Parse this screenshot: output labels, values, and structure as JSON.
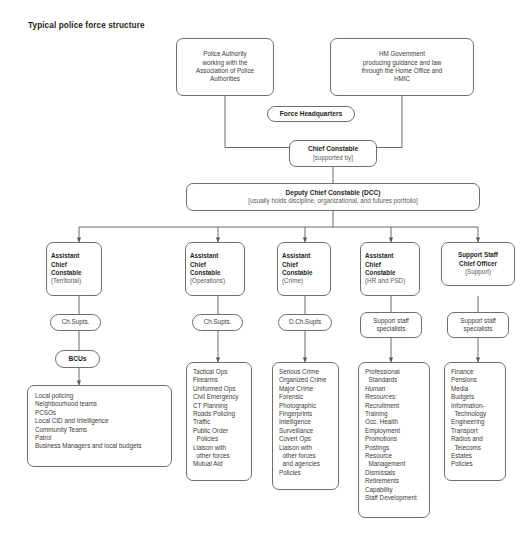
{
  "title": "Typical police force structure",
  "nodes": {
    "police_authority": {
      "name": "police-authority-box",
      "lines": [
        "Police Authority",
        "working with the",
        "Association of Police",
        "Authorities"
      ]
    },
    "hm_government": {
      "name": "hm-government-box",
      "lines": [
        "HM Government",
        "producing guidance and law",
        "through the Home Office and",
        "HMIC"
      ]
    },
    "force_headquarters": {
      "name": "force-headquarters-box",
      "label": "Force Headquarters"
    },
    "chief_constable": {
      "name": "chief-constable-box",
      "title": "Chief Constable",
      "sub": "[supported by]"
    },
    "dcc": {
      "name": "deputy-chief-constable-box",
      "title": "Deputy Chief Constable (DCC)",
      "sub": "[usually holds discipline, organizational, and futures portfolio]"
    }
  },
  "columns": [
    {
      "key": "territorial",
      "head": {
        "name": "acc-territorial-box",
        "title_lines": [
          "Assistant",
          "Chief",
          "Constable"
        ],
        "sub": "(Territorial)"
      },
      "mid": {
        "name": "ch-supts-territorial-box",
        "lines": [
          "Ch.Supts."
        ]
      },
      "sub_node": {
        "name": "bcus-box",
        "label": "BCUs"
      },
      "list": {
        "name": "territorial-functions-box",
        "items": [
          "Local policing",
          "Neighbourhood teams",
          "PCSOs",
          "Local CID and Intelligence",
          "Community Teams",
          "Patrol",
          "Business Managers and local budgets"
        ]
      }
    },
    {
      "key": "operations",
      "head": {
        "name": "acc-operations-box",
        "title_lines": [
          "Assistant",
          "Chief",
          "Constable"
        ],
        "sub": "(Operations)"
      },
      "mid": {
        "name": "ch-supts-operations-box",
        "lines": [
          "Ch.Supts."
        ]
      },
      "list": {
        "name": "operations-functions-box",
        "items": [
          "Tactical Ops",
          "Firearms",
          "Uniformed Ops",
          "Civil Emergency",
          "CT Planning",
          "Roads Policing",
          "Traffic",
          "Public Order",
          "  Policies",
          "Liaison with",
          "  other forces",
          "Mutual Aid"
        ]
      }
    },
    {
      "key": "crime",
      "head": {
        "name": "acc-crime-box",
        "title_lines": [
          "Assistant",
          "Chief",
          "Constable"
        ],
        "sub": "(Crime)"
      },
      "mid": {
        "name": "dch-supts-crime-box",
        "lines": [
          "D.Ch.Supts"
        ]
      },
      "list": {
        "name": "crime-functions-box",
        "items": [
          "Serious Crime",
          "Organized Crime",
          "Major Crime",
          "Forensic",
          "Photographic",
          "Fingerprints",
          "Intelligence",
          "Surveillance",
          "Covert Ops",
          "Liaison with",
          "  other forces",
          "  and agencies",
          "Policies"
        ]
      }
    },
    {
      "key": "hr_psd",
      "head": {
        "name": "acc-hr-psd-box",
        "title_lines": [
          "Assistant",
          "Chief",
          "Constable"
        ],
        "sub": "(HR and PSD)"
      },
      "mid": {
        "name": "support-staff-specialists-hr-box",
        "lines": [
          "Support staff",
          "specialists"
        ]
      },
      "list": {
        "name": "hr-psd-functions-box",
        "items": [
          "Professional",
          "  Standards",
          "Human",
          "Resources:",
          "Recruitment",
          "Training",
          "Occ. Health",
          "Employment",
          "Promotions",
          "Postings",
          "Resource",
          "  Management",
          "Dismissals",
          "Retirements",
          "Capability",
          "Staff Development"
        ],
        "italic_indices": [
          2,
          3
        ]
      }
    },
    {
      "key": "support",
      "head": {
        "name": "support-staff-chief-officer-box",
        "title_lines": [
          "Support Staff",
          "Chief Officer"
        ],
        "sub": "(Support)"
      },
      "mid": {
        "name": "support-staff-specialists-support-box",
        "lines": [
          "Support staff",
          "specialists"
        ]
      },
      "list": {
        "name": "support-functions-box",
        "items": [
          "Finance",
          "Pensions",
          "Media",
          "Budgets",
          "Information-",
          "  Technology",
          "Engineering",
          "Transport",
          "Radios and",
          "  Telecoms",
          "Estates",
          "Policies"
        ]
      }
    }
  ],
  "colors": {
    "stroke": "#6d6e71",
    "connector": "#58595b",
    "text": "#231f20",
    "muted": "#5a5a5a",
    "background": "#ffffff"
  }
}
